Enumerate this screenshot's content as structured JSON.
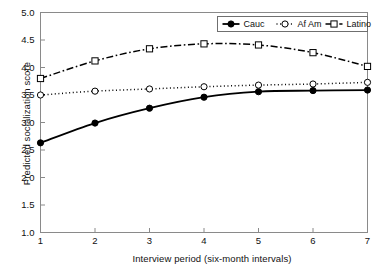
{
  "chart_data": {
    "type": "line",
    "title": "",
    "xlabel": "Interview period (six-month intervals)",
    "ylabel": "Predicted socialization score",
    "x": [
      1,
      2,
      3,
      4,
      5,
      6,
      7
    ],
    "xtick_labels": [
      "1",
      "2",
      "3",
      "4",
      "5",
      "6",
      "7"
    ],
    "ytick_labels": [
      "1.0",
      "1.5",
      "2.0",
      "2.5",
      "3.0",
      "3.5",
      "4.0",
      "4.5",
      "5.0"
    ],
    "yticks": [
      1.0,
      1.5,
      2.0,
      2.5,
      3.0,
      3.5,
      4.0,
      4.5,
      5.0
    ],
    "xlim": [
      1,
      7
    ],
    "ylim": [
      1.0,
      5.0
    ],
    "grid": false,
    "legend_position": "top-right",
    "series": [
      {
        "name": "Cauc",
        "values": [
          2.63,
          2.99,
          3.26,
          3.46,
          3.56,
          3.58,
          3.59
        ],
        "line_style": "solid",
        "marker": "filled-circle",
        "color": "#000000"
      },
      {
        "name": "Af Am",
        "values": [
          3.5,
          3.57,
          3.61,
          3.65,
          3.68,
          3.7,
          3.73
        ],
        "line_style": "dotted",
        "marker": "open-circle",
        "color": "#000000"
      },
      {
        "name": "Latino",
        "values": [
          3.8,
          4.12,
          4.34,
          4.43,
          4.41,
          4.27,
          4.02
        ],
        "line_style": "dash-dot",
        "marker": "open-square",
        "color": "#000000"
      }
    ]
  },
  "legend": {
    "entries": [
      {
        "label": "Cauc"
      },
      {
        "label": "Af Am"
      },
      {
        "label": "Latino"
      }
    ]
  },
  "axes": {
    "x_title": "Interview period (six-month intervals)",
    "y_title": "Predicted socialization score"
  }
}
